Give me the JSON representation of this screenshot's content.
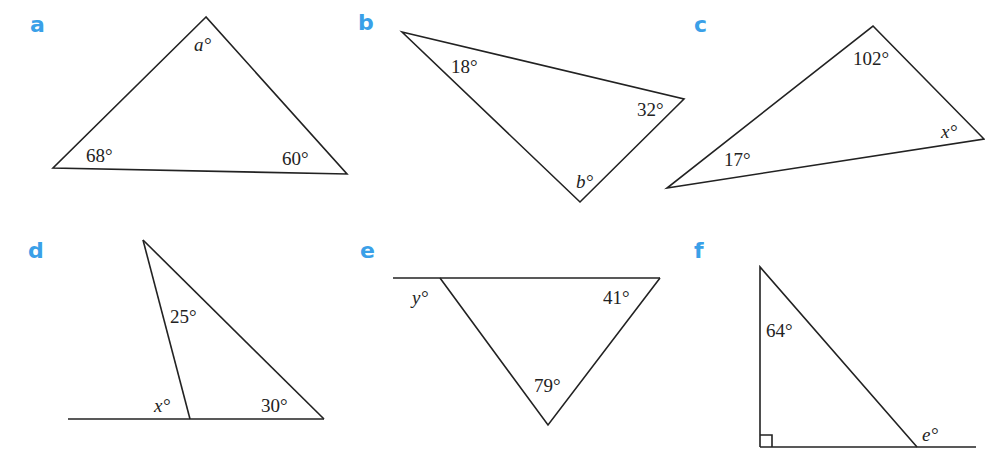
{
  "accent_color": "#3aa0e8",
  "problems": [
    {
      "id": "a",
      "label": "a",
      "angles": [
        "a°",
        "68°",
        "60°"
      ]
    },
    {
      "id": "b",
      "label": "b",
      "angles": [
        "18°",
        "32°",
        "b°"
      ]
    },
    {
      "id": "c",
      "label": "c",
      "angles": [
        "102°",
        "x°",
        "17°"
      ]
    },
    {
      "id": "d",
      "label": "d",
      "angles": [
        "25°",
        "x°",
        "30°"
      ]
    },
    {
      "id": "e",
      "label": "e",
      "angles": [
        "y°",
        "41°",
        "79°"
      ]
    },
    {
      "id": "f",
      "label": "f",
      "angles": [
        "64°",
        "e°"
      ],
      "right_angle_marker": true
    }
  ]
}
